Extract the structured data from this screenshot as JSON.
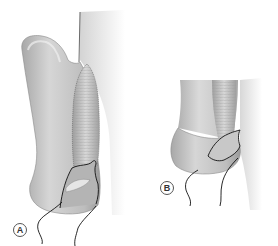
{
  "figure": {
    "panels": [
      {
        "id": "A",
        "label": "A"
      },
      {
        "id": "B",
        "label": "B"
      }
    ],
    "colors": {
      "skin_light": "#d9d9d9",
      "skin_mid": "#b8b8b8",
      "skin_dark": "#8c8c8c",
      "flap": "#c4c4c4",
      "outline": "#1a1a1a",
      "background": "#ffffff"
    }
  }
}
